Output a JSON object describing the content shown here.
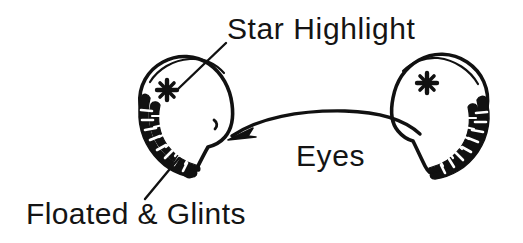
{
  "canvas": {
    "width": 523,
    "height": 243,
    "background_color": "#ffffff",
    "ink_color": "#111111",
    "style": "hand-drawn ink sketch"
  },
  "labels": {
    "star_highlight": "Star Highlight",
    "eyes": "Eyes",
    "floated_glints": "Floated & Glints"
  },
  "figure": {
    "title_hint": "Eyes",
    "left_eye": {
      "name": "left-eye",
      "has_star": true,
      "has_glint_band": true,
      "glint_band_position": "lower-left",
      "star_glyph": "six-point-asterisk"
    },
    "right_eye": {
      "name": "right-eye",
      "has_star": true,
      "has_glint_band": true,
      "glint_band_position": "lower-right",
      "star_glyph": "six-point-asterisk"
    },
    "connector": {
      "name": "eyes-connector-arc",
      "arrowhead": "left-end",
      "description": "arched line linking both eyes"
    },
    "leaders": [
      {
        "name": "star-highlight-leader",
        "from_label": "Star Highlight",
        "to_feature": "left-eye-star"
      },
      {
        "name": "floated-glints-leader",
        "from_label": "Floated & Glints",
        "to_feature": "left-eye-glint-band"
      }
    ]
  }
}
